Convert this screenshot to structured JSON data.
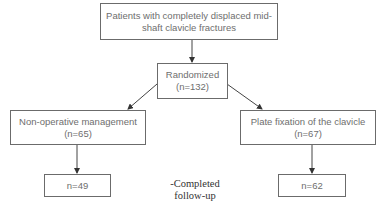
{
  "flowchart": {
    "top": {
      "line1": "Patients with completely displaced mid-",
      "line2": "shaft clavicle fractures"
    },
    "randomized": {
      "line1": "Randomized",
      "line2": "(n=132)"
    },
    "left_arm": {
      "line1": "Non-operative management",
      "line2": "(n=65)"
    },
    "right_arm": {
      "line1": "Plate fixation of the clavicle",
      "line2": "(n=67)"
    },
    "left_followup": {
      "label": "n=49"
    },
    "right_followup": {
      "label": "n=62"
    },
    "followup_note": {
      "line1": "-Completed",
      "line2": "follow-up"
    }
  },
  "colors": {
    "border": "#6b6b6b",
    "text": "#6e6e6e",
    "arrow": "#333333"
  }
}
